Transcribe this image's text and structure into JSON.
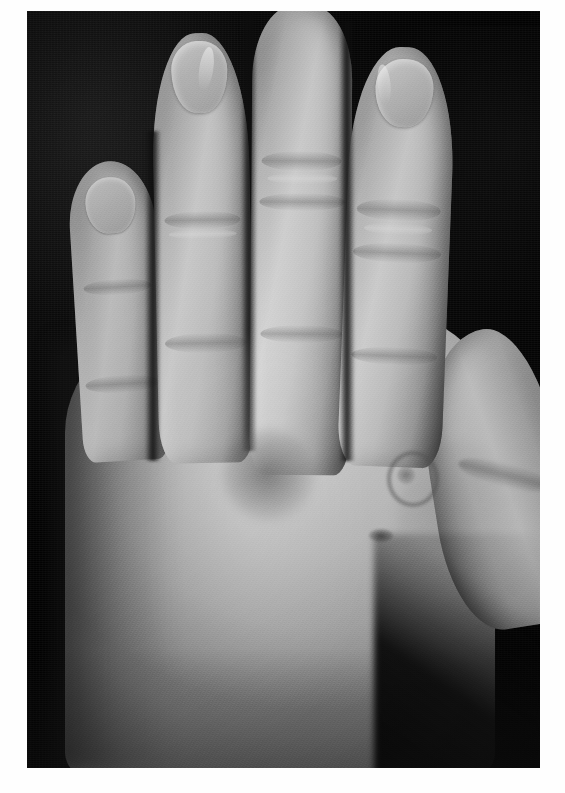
{
  "page": {
    "kind": "clinical-photograph",
    "color_mode": "grayscale",
    "width": 565,
    "height": 793,
    "background_color": "#fefefe"
  },
  "photo": {
    "frame": {
      "x": 27,
      "y": 11,
      "width": 513,
      "height": 757
    },
    "backdrop": {
      "description": "dark woven cloth backdrop",
      "color": "#0a0907"
    },
    "subject": {
      "description": "dorsum of a human hand, fingers extended, photographed against a dark cloth",
      "view": "dorsal",
      "skin_tone_hex": "#c3bdb4",
      "shadow_hex": "#6e6961"
    },
    "anatomy": {
      "fingers": [
        {
          "name": "little-finger",
          "label": "Little finger",
          "has_nail": true
        },
        {
          "name": "ring-finger",
          "label": "Ring finger",
          "has_nail": true
        },
        {
          "name": "middle-finger",
          "label": "Middle finger",
          "has_nail": false
        },
        {
          "name": "index-finger",
          "label": "Index finger",
          "has_nail": true
        },
        {
          "name": "thumb",
          "label": "Thumb",
          "has_nail": false
        }
      ],
      "regions": [
        {
          "name": "dorsum",
          "label": "Dorsum of hand"
        },
        {
          "name": "wrist",
          "label": "Wrist"
        },
        {
          "name": "thumb-web-space",
          "label": "First web space"
        }
      ]
    },
    "findings": [
      {
        "name": "lesion-patch",
        "label": "Diffuse ill-defined darker patch",
        "location": "dorsum, over fourth metacarpal",
        "shape": "ill-defined macule",
        "approx_px": {
          "x": 196,
          "y": 418,
          "width": 92,
          "height": 92
        }
      },
      {
        "name": "lesion-ring",
        "label": "Annular lesion with central clearing",
        "location": "dorsum, over second metacarpal",
        "shape": "annular",
        "approx_px": {
          "x": 360,
          "y": 440,
          "width": 44,
          "height": 48
        }
      },
      {
        "name": "lesion-papule",
        "label": "Small crusted papule",
        "location": "distal dorsum, radial aspect",
        "shape": "oval papule",
        "approx_px": {
          "x": 342,
          "y": 518,
          "width": 24,
          "height": 13
        }
      }
    ]
  }
}
